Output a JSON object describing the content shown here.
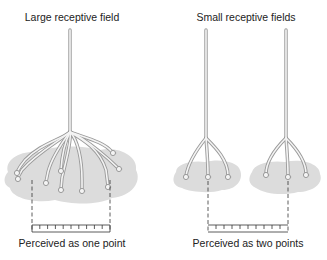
{
  "labels": {
    "large_title": "Large receptive field",
    "small_title": "Small receptive fields",
    "large_caption": "Perceived as one point",
    "small_caption": "Perceived as two points"
  },
  "colors": {
    "fiber_fill": "#f4f4f4",
    "fiber_stroke": "#9a9a9a",
    "field_fill": "#dcdcdc",
    "line": "#333333",
    "text": "#222222"
  },
  "ruler": {
    "left_ticks": 10,
    "right_ticks": 10
  }
}
